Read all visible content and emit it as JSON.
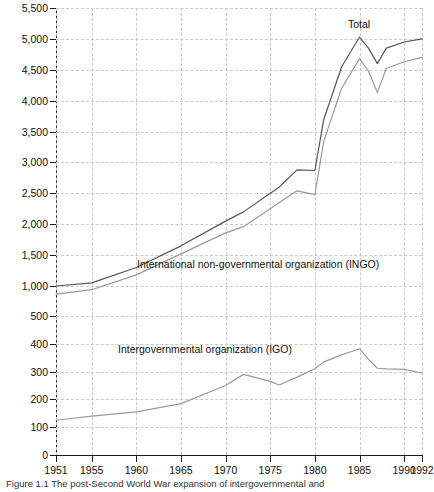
{
  "figure": {
    "caption": "Figure 1.1   The post-Second World War expansion of intergovernmental and"
  },
  "annotations": {
    "total": "Total",
    "ingo": "International non-governmental organization (INGO)",
    "igo": "Intergovernmental organization (IGO)"
  },
  "colors": {
    "total_line": "#555555",
    "ingo_line": "#9a9a9a",
    "igo_line": "#9a9a9a",
    "axis": "#1a1a1a",
    "grid": "#c9c9c9",
    "background": "#ffffff"
  },
  "axes": {
    "y_upper_ticks": [
      "1,000",
      "1,500",
      "2,000",
      "2,500",
      "3,000",
      "3,500",
      "4,000",
      "4,500",
      "5,000",
      "5,500"
    ],
    "y_lower_ticks": [
      "0",
      "100",
      "200",
      "300",
      "400",
      "500"
    ],
    "y_break": true,
    "x_ticks": [
      "1951",
      "1955",
      "1960",
      "1965",
      "1970",
      "1975",
      "1980",
      "1985",
      "1990",
      "1992"
    ]
  },
  "chart_data": {
    "type": "line",
    "title": "",
    "xlabel": "",
    "ylabel": "",
    "grid": true,
    "legend": "inline-annotations",
    "y_axis_note": "Broken axis: lower band 0-500 (step 100), upper band 1,000-5,500 (step 500)",
    "ylim_lower": [
      0,
      500
    ],
    "ylim_upper": [
      1000,
      5500
    ],
    "xlim": [
      1951,
      1992
    ],
    "x": [
      1951,
      1955,
      1960,
      1965,
      1970,
      1972,
      1975,
      1976,
      1978,
      1980,
      1981,
      1983,
      1985,
      1986,
      1987,
      1988,
      1990,
      1992
    ],
    "series": [
      {
        "name": "Total",
        "axis": "upper",
        "color": "#555555",
        "values": [
          1000,
          1050,
          1300,
          1650,
          2050,
          2200,
          2500,
          2600,
          2880,
          2870,
          3700,
          4550,
          5030,
          4850,
          4600,
          4850,
          4950,
          5000
        ]
      },
      {
        "name": "International non-governmental organization (INGO)",
        "axis": "upper",
        "color": "#9a9a9a",
        "values": [
          870,
          940,
          1180,
          1520,
          1860,
          1960,
          2250,
          2350,
          2540,
          2480,
          3350,
          4200,
          4680,
          4480,
          4130,
          4520,
          4630,
          4700
        ]
      },
      {
        "name": "Intergovernmental organization (IGO)",
        "axis": "lower",
        "color": "#9a9a9a",
        "values": [
          125,
          140,
          155,
          185,
          250,
          290,
          265,
          252,
          280,
          310,
          335,
          360,
          382,
          345,
          312,
          310,
          308,
          295
        ]
      }
    ]
  }
}
